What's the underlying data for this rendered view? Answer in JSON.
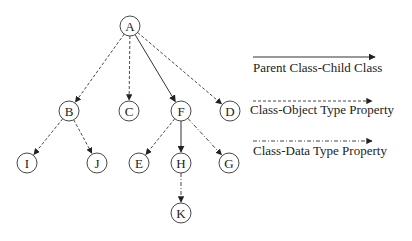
{
  "diagram": {
    "type": "class-hierarchy-tree",
    "node_radius": 10,
    "nodes": [
      {
        "id": "A",
        "label": "A",
        "x": 130,
        "y": 26
      },
      {
        "id": "B",
        "label": "B",
        "x": 69,
        "y": 111
      },
      {
        "id": "C",
        "label": "C",
        "x": 129,
        "y": 111
      },
      {
        "id": "F",
        "label": "F",
        "x": 181,
        "y": 111
      },
      {
        "id": "D",
        "label": "D",
        "x": 230,
        "y": 111
      },
      {
        "id": "I",
        "label": "I",
        "x": 27,
        "y": 163
      },
      {
        "id": "J",
        "label": "J",
        "x": 97,
        "y": 163
      },
      {
        "id": "E",
        "label": "E",
        "x": 139,
        "y": 163
      },
      {
        "id": "H",
        "label": "H",
        "x": 181,
        "y": 163
      },
      {
        "id": "G",
        "label": "G",
        "x": 229,
        "y": 163
      },
      {
        "id": "K",
        "label": "K",
        "x": 181,
        "y": 213
      }
    ],
    "edges": [
      {
        "from": "A",
        "to": "B",
        "style": "object"
      },
      {
        "from": "A",
        "to": "C",
        "style": "object"
      },
      {
        "from": "A",
        "to": "F",
        "style": "solid"
      },
      {
        "from": "A",
        "to": "D",
        "style": "object"
      },
      {
        "from": "B",
        "to": "I",
        "style": "object"
      },
      {
        "from": "B",
        "to": "J",
        "style": "object"
      },
      {
        "from": "F",
        "to": "E",
        "style": "object"
      },
      {
        "from": "F",
        "to": "H",
        "style": "solid"
      },
      {
        "from": "F",
        "to": "G",
        "style": "data"
      },
      {
        "from": "H",
        "to": "K",
        "style": "data"
      }
    ]
  },
  "legend": {
    "items": [
      {
        "style": "solid",
        "label": "Parent Class-Child Class",
        "line_y": 57,
        "label_y": 72
      },
      {
        "style": "object",
        "label": "Class-Object Type Property",
        "line_y": 101,
        "label_y": 114
      },
      {
        "style": "data",
        "label": "Class-Data Type Property",
        "line_y": 141,
        "label_y": 155
      }
    ]
  },
  "colors": {
    "stroke": "#333333",
    "text": "#222222",
    "background": "#ffffff"
  }
}
